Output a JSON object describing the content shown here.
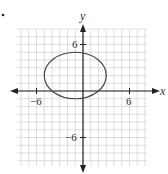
{
  "figure": {
    "bullet": "•",
    "x_axis_label": "x",
    "y_axis_label": "y",
    "tick_labels": {
      "x_neg": "−6",
      "x_pos": "6",
      "y_pos": "6",
      "y_neg": "−6"
    }
  },
  "chart_data": {
    "type": "diagram",
    "title": "",
    "xlabel": "x",
    "ylabel": "y",
    "xlim": [
      -8.5,
      8
    ],
    "ylim": [
      -9.5,
      8
    ],
    "grid": true,
    "grid_step": 1,
    "labeled_ticks": {
      "x": [
        -6,
        6
      ],
      "y": [
        6,
        -6
      ]
    },
    "shapes": [
      {
        "kind": "ellipse",
        "center": [
          -1,
          2
        ],
        "rx": 4,
        "ry": 3,
        "equation": "(x+1)^2/16 + (y-2)^2/9 = 1"
      }
    ]
  }
}
